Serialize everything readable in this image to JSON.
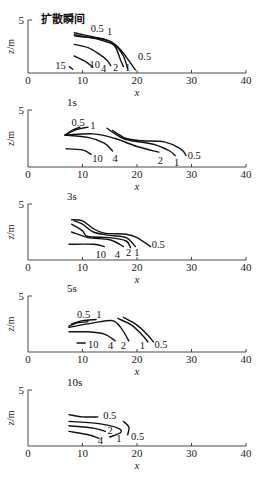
{
  "chart_data": [
    {
      "type": "contour",
      "title": "扩散瞬间",
      "xlabel": "x",
      "ylabel": "z/m",
      "xlim": [
        0,
        40
      ],
      "ylim": [
        0,
        5
      ],
      "xticks": [
        "0",
        "10",
        "20",
        "30",
        "40"
      ],
      "yticks": [
        "5"
      ],
      "contours": [
        {
          "level": "0.5",
          "points": [
            [
              8.5,
              3.5
            ],
            [
              12,
              3.3
            ],
            [
              15,
              3.0
            ],
            [
              17,
              2.2
            ],
            [
              19,
              0.8
            ],
            [
              19.7,
              0.3
            ]
          ]
        },
        {
          "level": "1",
          "points": [
            [
              8.5,
              3.6
            ],
            [
              12,
              3.3
            ],
            [
              14,
              3.0
            ],
            [
              16,
              2.6
            ],
            [
              17.5,
              1.6
            ],
            [
              18.3,
              0.4
            ]
          ]
        },
        {
          "level": "2",
          "points": [
            [
              8.5,
              3.8
            ],
            [
              12,
              3.4
            ],
            [
              14.5,
              3.1
            ],
            [
              16,
              2.5
            ],
            [
              17,
              1.2
            ],
            [
              17.5,
              0.6
            ]
          ]
        },
        {
          "level": "4",
          "points": [
            [
              8.5,
              2.7
            ],
            [
              11,
              2.4
            ],
            [
              13,
              1.8
            ],
            [
              14.5,
              1.2
            ],
            [
              15.2,
              0.7
            ]
          ]
        },
        {
          "level": "10",
          "points": [
            [
              8.5,
              1.6
            ],
            [
              10.5,
              1.1
            ],
            [
              11.8,
              0.6
            ]
          ]
        },
        {
          "level": "15",
          "points": [
            [
              7.6,
              0.6
            ],
            [
              8.2,
              0.35
            ]
          ]
        }
      ],
      "labels": [
        {
          "text": "0.5",
          "x": 11.5,
          "z": 3.9
        },
        {
          "text": "1",
          "x": 14.5,
          "z": 3.6
        },
        {
          "text": "0.5",
          "x": 20.2,
          "z": 1.2
        },
        {
          "text": "1",
          "x": 17.8,
          "z": 0.2
        },
        {
          "text": "2",
          "x": 15.6,
          "z": 0.2
        },
        {
          "text": "4",
          "x": 13.4,
          "z": 0.1
        },
        {
          "text": "10",
          "x": 11.3,
          "z": 0.5
        },
        {
          "text": "15",
          "x": 5,
          "z": 0.4
        }
      ]
    },
    {
      "type": "contour",
      "title": "1s",
      "xlabel": "x",
      "ylabel": "z/m",
      "xlim": [
        0,
        40
      ],
      "ylim": [
        0,
        5
      ],
      "xticks": [
        "0",
        "10",
        "20",
        "30",
        "40"
      ],
      "yticks": [
        "5"
      ],
      "contours": [
        {
          "level": "0.5 (left)",
          "points": [
            [
              6.8,
              2.8
            ],
            [
              8,
              3.2
            ],
            [
              9.5,
              3.5
            ]
          ]
        },
        {
          "level": "1 (left)",
          "points": [
            [
              6.8,
              2.8
            ],
            [
              9,
              3.3
            ],
            [
              11,
              3.5
            ]
          ]
        },
        {
          "level": "0.5",
          "points": [
            [
              15.5,
              3.2
            ],
            [
              18,
              2.5
            ],
            [
              21,
              2.3
            ],
            [
              25,
              2.2
            ],
            [
              28,
              1.6
            ],
            [
              29,
              1.0
            ]
          ]
        },
        {
          "level": "1",
          "points": [
            [
              14.5,
              3.4
            ],
            [
              17,
              2.6
            ],
            [
              19,
              2.3
            ],
            [
              23,
              2.0
            ],
            [
              26,
              1.4
            ],
            [
              27,
              1.0
            ]
          ]
        },
        {
          "level": "2",
          "points": [
            [
              6.8,
              2.8
            ],
            [
              12,
              2.9
            ],
            [
              16,
              2.5
            ],
            [
              20,
              1.8
            ],
            [
              24,
              1.3
            ]
          ]
        },
        {
          "level": "4",
          "points": [
            [
              6.8,
              2.8
            ],
            [
              11,
              2.6
            ],
            [
              14,
              2.1
            ],
            [
              15.5,
              1.4
            ]
          ]
        },
        {
          "level": "10",
          "points": [
            [
              7,
              1.6
            ],
            [
              10,
              1.5
            ],
            [
              11.6,
              1.1
            ]
          ]
        }
      ],
      "labels": [
        {
          "text": "0.5",
          "x": 8,
          "z": 3.6
        },
        {
          "text": "1",
          "x": 11.4,
          "z": 3.3
        },
        {
          "text": "0.5",
          "x": 29.3,
          "z": 0.7
        },
        {
          "text": "1",
          "x": 26.8,
          "z": 0.1
        },
        {
          "text": "2",
          "x": 23.8,
          "z": 0.3
        },
        {
          "text": "4",
          "x": 15.5,
          "z": 0.4
        },
        {
          "text": "10",
          "x": 11.8,
          "z": 0.4
        }
      ]
    },
    {
      "type": "contour",
      "title": "3s",
      "xlabel": "x",
      "ylabel": "z/m",
      "xlim": [
        0,
        40
      ],
      "ylim": [
        0,
        5
      ],
      "xticks": [
        "0",
        "10",
        "20",
        "30",
        "40"
      ],
      "yticks": [
        "5"
      ],
      "contours": [
        {
          "level": "0.5",
          "points": [
            [
              8,
              3.6
            ],
            [
              10,
              3.5
            ],
            [
              12,
              2.8
            ],
            [
              14,
              2.4
            ],
            [
              18,
              2.3
            ],
            [
              20,
              2.0
            ],
            [
              22.5,
              1.2
            ]
          ]
        },
        {
          "level": "1",
          "points": [
            [
              8.5,
              3.5
            ],
            [
              10,
              3.2
            ],
            [
              12,
              2.5
            ],
            [
              15,
              2.2
            ],
            [
              18,
              2.0
            ],
            [
              19.7,
              1.2
            ]
          ]
        },
        {
          "level": "2",
          "points": [
            [
              8,
              3.2
            ],
            [
              10,
              2.6
            ],
            [
              11,
              2.1
            ],
            [
              15,
              2.0
            ],
            [
              18,
              1.7
            ],
            [
              18.8,
              1.1
            ]
          ]
        },
        {
          "level": "4",
          "points": [
            [
              8,
              2.5
            ],
            [
              11,
              2.0
            ],
            [
              15,
              1.8
            ],
            [
              17.5,
              1.2
            ]
          ]
        },
        {
          "level": "10",
          "points": [
            [
              7.5,
              1.4
            ],
            [
              12,
              1.4
            ],
            [
              14,
              1.2
            ]
          ]
        }
      ],
      "labels": [
        {
          "text": "0.5",
          "x": 22.7,
          "z": 1.1
        },
        {
          "text": "1",
          "x": 19.5,
          "z": 0.4
        },
        {
          "text": "2",
          "x": 18,
          "z": 0.4
        },
        {
          "text": "4",
          "x": 15.9,
          "z": 0.2
        },
        {
          "text": "10",
          "x": 12.4,
          "z": 0.2
        }
      ]
    },
    {
      "type": "contour",
      "title": "5s",
      "xlabel": "x",
      "ylabel": "z/m",
      "xlim": [
        0,
        40
      ],
      "ylim": [
        0,
        5
      ],
      "xticks": [
        "0",
        "10",
        "20",
        "30",
        "40"
      ],
      "yticks": [
        "5"
      ],
      "contours": [
        {
          "level": "0.5 (left)",
          "points": [
            [
              7.5,
              2.3
            ],
            [
              9,
              2.6
            ],
            [
              11,
              2.7
            ]
          ]
        },
        {
          "level": "1 (left)",
          "points": [
            [
              8,
              2.5
            ],
            [
              10,
              2.8
            ],
            [
              12.5,
              2.9
            ]
          ]
        },
        {
          "level": "1",
          "points": [
            [
              16.5,
              3.0
            ],
            [
              19,
              2.4
            ],
            [
              21,
              1.5
            ],
            [
              22,
              0.9
            ]
          ]
        },
        {
          "level": "0.5",
          "points": [
            [
              17.5,
              3.1
            ],
            [
              20,
              2.4
            ],
            [
              22,
              1.5
            ],
            [
              23,
              0.9
            ]
          ]
        },
        {
          "level": "2",
          "points": [
            [
              7.5,
              2.2
            ],
            [
              12,
              2.6
            ],
            [
              15.5,
              2.8
            ],
            [
              17,
              2.2
            ],
            [
              18.5,
              1.0
            ]
          ]
        },
        {
          "level": "4",
          "points": [
            [
              7.5,
              1.8
            ],
            [
              11,
              1.8
            ],
            [
              14,
              1.6
            ],
            [
              16,
              1.0
            ]
          ]
        },
        {
          "level": "10",
          "points": [
            [
              9,
              0.8
            ],
            [
              10.5,
              0.8
            ]
          ]
        }
      ],
      "labels": [
        {
          "text": "0.5",
          "x": 9,
          "z": 3.0
        },
        {
          "text": "1",
          "x": 12.5,
          "z": 3.0
        },
        {
          "text": "0.5",
          "x": 23.2,
          "z": 0.4
        },
        {
          "text": "1",
          "x": 20.5,
          "z": 0.3
        },
        {
          "text": "2",
          "x": 17,
          "z": 0.3
        },
        {
          "text": "4",
          "x": 14.7,
          "z": 0.3
        },
        {
          "text": "10",
          "x": 11,
          "z": 0.4
        }
      ]
    },
    {
      "type": "contour",
      "title": "10s",
      "xlabel": "x",
      "ylabel": "z/m",
      "xlim": [
        0,
        40
      ],
      "ylim": [
        0,
        5
      ],
      "xticks": [
        "0",
        "10",
        "20",
        "30",
        "40"
      ],
      "yticks": [
        "5"
      ],
      "contours": [
        {
          "level": "0.5",
          "points": [
            [
              7.5,
              2.8
            ],
            [
              10,
              2.6
            ],
            [
              12.8,
              2.6
            ]
          ]
        },
        {
          "level": "0.5 (right)",
          "points": [
            [
              17.5,
              2.2
            ],
            [
              18.5,
              1.7
            ],
            [
              18.3,
              1.0
            ]
          ]
        },
        {
          "level": "1",
          "points": [
            [
              7.5,
              2.2
            ],
            [
              13,
              2.0
            ],
            [
              16.5,
              1.6
            ],
            [
              17,
              1.2
            ],
            [
              15,
              0.8
            ]
          ]
        },
        {
          "level": "2",
          "points": [
            [
              7.5,
              1.8
            ],
            [
              12,
              1.6
            ],
            [
              14.2,
              1.3
            ]
          ]
        },
        {
          "level": "4",
          "points": [
            [
              7.5,
              1.3
            ],
            [
              11,
              1.0
            ],
            [
              13,
              0.7
            ]
          ]
        }
      ],
      "labels": [
        {
          "text": "0.5",
          "x": 13.8,
          "z": 2.4
        },
        {
          "text": "0.5",
          "x": 18.9,
          "z": 0.5
        },
        {
          "text": "2",
          "x": 14.6,
          "z": 1.1
        },
        {
          "text": "1",
          "x": 16.2,
          "z": 0.4
        },
        {
          "text": "4",
          "x": 12.8,
          "z": 0.2
        }
      ]
    }
  ]
}
